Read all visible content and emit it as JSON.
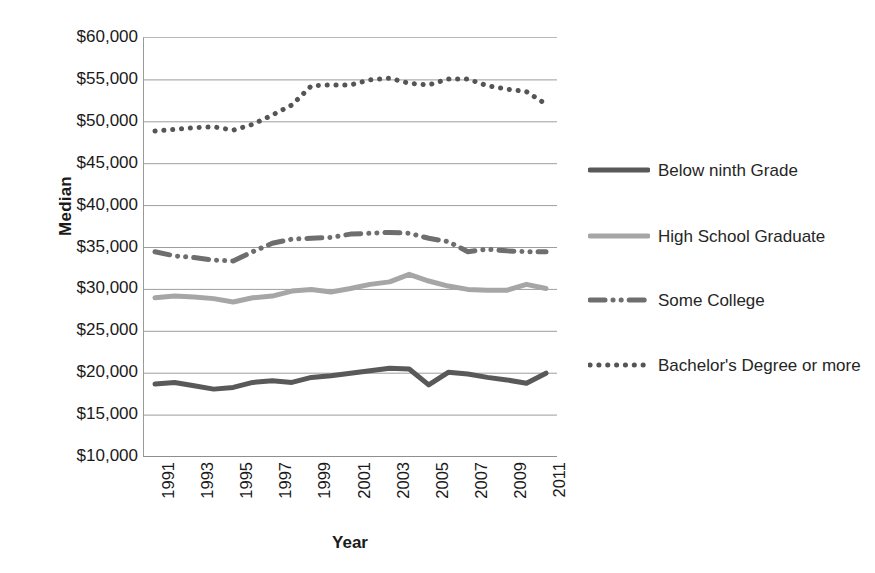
{
  "chart_data": {
    "type": "line",
    "title": "",
    "xlabel": "Year",
    "ylabel": "Median",
    "xlim": [
      1991,
      2011
    ],
    "ylim": [
      10000,
      60000
    ],
    "grid": true,
    "legend_position": "right",
    "y_ticks": [
      "$10,000",
      "$15,000",
      "$20,000",
      "$25,000",
      "$30,000",
      "$35,000",
      "$40,000",
      "$45,000",
      "$50,000",
      "$55,000",
      "$60,000"
    ],
    "y_tick_values": [
      10000,
      15000,
      20000,
      25000,
      30000,
      35000,
      40000,
      45000,
      50000,
      55000,
      60000
    ],
    "x_ticks": [
      "1991",
      "1993",
      "1995",
      "1997",
      "1999",
      "2001",
      "2003",
      "2005",
      "2007",
      "2009",
      "2011"
    ],
    "x_tick_values": [
      1991,
      1993,
      1995,
      1997,
      1999,
      2001,
      2003,
      2005,
      2007,
      2009,
      2011
    ],
    "x": [
      1991,
      1992,
      1993,
      1994,
      1995,
      1996,
      1997,
      1998,
      1999,
      2000,
      2001,
      2002,
      2003,
      2004,
      2005,
      2006,
      2007,
      2008,
      2009,
      2010,
      2011
    ],
    "series": [
      {
        "name": "Below ninth Grade",
        "style": "solid",
        "color": "#595959",
        "width": 5,
        "values": [
          18700,
          18900,
          18500,
          18100,
          18300,
          18900,
          19100,
          18900,
          19500,
          19700,
          20000,
          20300,
          20600,
          20500,
          18600,
          20100,
          19900,
          19500,
          19200,
          18800,
          20000
        ]
      },
      {
        "name": "High School Graduate",
        "style": "solid",
        "color": "#a6a6a6",
        "width": 5,
        "values": [
          29000,
          29200,
          29100,
          28900,
          28500,
          29000,
          29200,
          29800,
          30000,
          29700,
          30100,
          30600,
          30900,
          31800,
          31000,
          30400,
          30000,
          29900,
          29900,
          30600,
          30100
        ]
      },
      {
        "name": "Some College",
        "style": "dashdot",
        "color": "#6e6e6e",
        "width": 5,
        "values": [
          34500,
          34000,
          33800,
          33500,
          33400,
          34500,
          35500,
          36000,
          36100,
          36200,
          36600,
          36700,
          36800,
          36700,
          36100,
          35700,
          34500,
          34800,
          34600,
          34500,
          34500
        ]
      },
      {
        "name": "Bachelor's Degree or more",
        "style": "dotted",
        "color": "#555555",
        "width": 5,
        "values": [
          48900,
          49100,
          49300,
          49400,
          49000,
          49700,
          50800,
          52000,
          54300,
          54400,
          54400,
          55000,
          55200,
          54600,
          54400,
          55100,
          55100,
          54300,
          53900,
          53600,
          52100
        ]
      }
    ]
  },
  "axes": {
    "y_title": "Median",
    "x_title": "Year"
  },
  "legend": {
    "items": [
      {
        "label": "Below ninth Grade",
        "icon": "solid-line-swatch"
      },
      {
        "label": "High School Graduate",
        "icon": "solid-line-swatch"
      },
      {
        "label": "Some College",
        "icon": "dash-dot-line-swatch"
      },
      {
        "label": "Bachelor's Degree or more",
        "icon": "dotted-line-swatch"
      }
    ]
  }
}
